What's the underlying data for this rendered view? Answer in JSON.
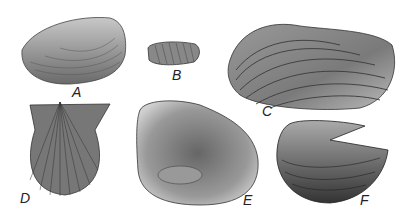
{
  "figure": {
    "specimens": [
      {
        "label": "A",
        "description": "ovate bivalve shell with concentric ridges"
      },
      {
        "label": "B",
        "description": "small elongate ribbed shell"
      },
      {
        "label": "C",
        "description": "large elongate shell with strong concentric ridges"
      },
      {
        "label": "D",
        "description": "scallop-like radially ribbed shell with ears"
      },
      {
        "label": "E",
        "description": "interior view of shell valve"
      },
      {
        "label": "F",
        "description": "shell with notched/flared margin"
      }
    ],
    "colors": {
      "background": "#ffffff",
      "ink": "#333333",
      "mid": "#777777",
      "light": "#bbbbbb"
    }
  }
}
